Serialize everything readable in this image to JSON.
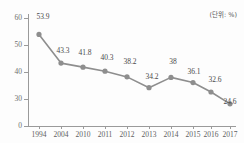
{
  "chart_data": {
    "type": "line",
    "title": "",
    "subtitle": "",
    "xlabel": "",
    "ylabel": "",
    "unit_note": "(단위: %)",
    "categories": [
      "1994",
      "2004",
      "2010",
      "2011",
      "2012",
      "2013",
      "2014",
      "2015",
      "2016",
      "2017"
    ],
    "values": [
      53.9,
      43.3,
      41.8,
      40.3,
      38.2,
      34.2,
      38,
      36.1,
      32.6,
      24.6
    ],
    "point_labels": [
      "53.9",
      "43.3",
      "41.8",
      "40.3",
      "38.2",
      "34.2",
      "38",
      "36.1",
      "32.6",
      "24.6"
    ],
    "series": [
      {
        "name": "",
        "values": [
          53.9,
          43.3,
          41.8,
          40.3,
          38.2,
          34.2,
          38,
          36.1,
          32.6,
          24.6
        ],
        "color": "#8e8e8e",
        "marker": "circle"
      }
    ],
    "ylim": [
      0,
      60
    ],
    "yticks": [
      0,
      30,
      40,
      50,
      60
    ],
    "ytick_labels": [
      "0",
      "30",
      "40",
      "50",
      "60"
    ],
    "axis_break": true,
    "grid": false,
    "legend": false,
    "legend_position": "none"
  },
  "style": {
    "line_color": "#8e8e8e",
    "marker_color": "#8a8a8a",
    "axis_color": "#9a9a9a",
    "label_color": "#4a4a4a",
    "tick_color": "#6e6e6e",
    "background": "#fdfdfd"
  }
}
